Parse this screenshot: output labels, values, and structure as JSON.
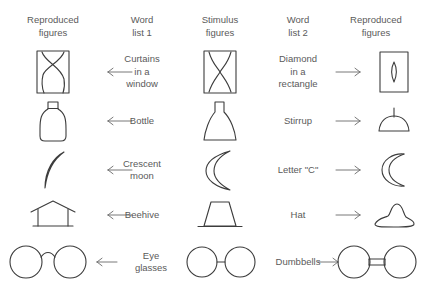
{
  "diagram": {
    "ink_color": "#3c3c3c",
    "text_color": "#5a5a5a",
    "background": "#ffffff",
    "columns": [
      {
        "id": "reproduced-left",
        "line1": "Reproduced",
        "line2": "figures"
      },
      {
        "id": "word-list-1",
        "line1": "Word",
        "line2": "list 1"
      },
      {
        "id": "stimulus",
        "line1": "Stimulus",
        "line2": "figures"
      },
      {
        "id": "word-list-2",
        "line1": "Word",
        "line2": "list 2"
      },
      {
        "id": "reproduced-right",
        "line1": "Reproduced",
        "line2": "figures"
      }
    ],
    "arrows": {
      "left_glyph": "left-arrow",
      "right_glyph": "right-arrow"
    },
    "rows": [
      {
        "id": "row-curtains-diamond",
        "stimulus_figure": "rectangle-with-curved-diamond",
        "left_figure": "rectangle-with-crossed-curtains",
        "right_figure": "rectangle-with-small-diamond",
        "word_left": {
          "line1": "Curtains",
          "line2": "in a",
          "line3": "window"
        },
        "word_right": {
          "line1": "Diamond",
          "line2": "in a",
          "line3": "rectangle"
        }
      },
      {
        "id": "row-bottle-stirrup",
        "stimulus_figure": "flask-trapezoid-with-neck",
        "left_figure": "bottle",
        "right_figure": "stirrup-dome",
        "word_left": {
          "line1": "Bottle",
          "line2": "",
          "line3": ""
        },
        "word_right": {
          "line1": "Stirrup",
          "line2": "",
          "line3": ""
        }
      },
      {
        "id": "row-crescent-letter-c",
        "stimulus_figure": "crescent",
        "left_figure": "thin-crescent-moon",
        "right_figure": "letter-c-shape",
        "word_left": {
          "line1": "Crescent",
          "line2": "moon",
          "line3": ""
        },
        "word_right": {
          "line1": "Letter \"C\"",
          "line2": "",
          "line3": ""
        }
      },
      {
        "id": "row-beehive-hat",
        "stimulus_figure": "trapezoid-on-baseline",
        "left_figure": "beehive-house-outline",
        "right_figure": "hat-blob",
        "word_left": {
          "line1": "Beehive",
          "line2": "",
          "line3": ""
        },
        "word_right": {
          "line1": "Hat",
          "line2": "",
          "line3": ""
        }
      },
      {
        "id": "row-eyeglasses-dumbbells",
        "stimulus_figure": "two-circles-joined-by-line",
        "left_figure": "eye-glasses",
        "right_figure": "dumbbells",
        "word_left": {
          "line1": "Eye",
          "line2": "glasses",
          "line3": ""
        },
        "word_right": {
          "line1": "Dumbbells",
          "line2": "",
          "line3": ""
        }
      }
    ]
  }
}
